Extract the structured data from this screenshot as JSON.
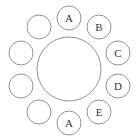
{
  "diagram": {
    "type": "round-table-seating",
    "table": {
      "cx": 69,
      "cy": 69,
      "r": 32
    },
    "seats": [
      {
        "cx": 69,
        "cy": 18,
        "label": "A"
      },
      {
        "cx": 99,
        "cy": 27,
        "label": "B"
      },
      {
        "cx": 118,
        "cy": 53,
        "label": "C"
      },
      {
        "cx": 118,
        "cy": 86,
        "label": "D"
      },
      {
        "cx": 99,
        "cy": 112,
        "label": "E"
      },
      {
        "cx": 69,
        "cy": 123,
        "label": "A"
      },
      {
        "cx": 39,
        "cy": 112,
        "label": ""
      },
      {
        "cx": 21,
        "cy": 86,
        "label": ""
      },
      {
        "cx": 21,
        "cy": 53,
        "label": ""
      },
      {
        "cx": 39,
        "cy": 27,
        "label": ""
      }
    ],
    "seat_radius": 12,
    "stroke_color": "#777777"
  }
}
